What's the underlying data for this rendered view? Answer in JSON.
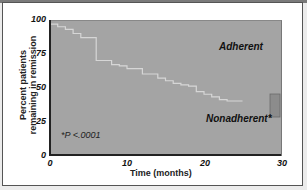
{
  "chart_data": {
    "type": "line",
    "subtype": "kaplan-meier-step",
    "title": "",
    "xlabel": "Time (months)",
    "ylabel": "Percent patients remaining in remission",
    "xlim": [
      0,
      30
    ],
    "ylim": [
      0,
      100
    ],
    "x_ticks": [
      "0",
      "10",
      "20",
      "30"
    ],
    "y_ticks": [
      "0",
      "25",
      "50",
      "75",
      "100"
    ],
    "grid": false,
    "series": [
      {
        "name": "Adherent",
        "x": [
          0,
          30
        ],
        "values": [
          100,
          100
        ]
      },
      {
        "name": "Nonadherent",
        "x": [
          0,
          1,
          2,
          3,
          4,
          5,
          6,
          7,
          8,
          9,
          10,
          11,
          12,
          13,
          14,
          15,
          16,
          17,
          18,
          19,
          20,
          21,
          22,
          23,
          24
        ],
        "values": [
          97,
          95,
          93,
          90,
          87,
          87,
          70,
          70,
          67,
          66,
          64,
          64,
          60,
          60,
          57,
          55,
          53,
          52,
          51,
          47,
          45,
          43,
          41,
          40,
          40
        ]
      }
    ],
    "annotations": [
      "*P <.0001"
    ],
    "legend_position": "inline-labels"
  },
  "labels": {
    "adherent": "Adherent",
    "nonadherent": "Nonadherent*",
    "pvalue": "*P <.0001",
    "xlabel": "Time (months)",
    "ylabel_line1": "Percent patients",
    "ylabel_line2": "remaining in remission"
  },
  "ticks": {
    "y": [
      "100",
      "75",
      "50",
      "25",
      "0"
    ],
    "x": [
      "0",
      "10",
      "20",
      "30"
    ]
  },
  "colors": {
    "plot_bg": "#a4a4a4",
    "curve": "#d8d8d8",
    "axis": "#222222"
  }
}
